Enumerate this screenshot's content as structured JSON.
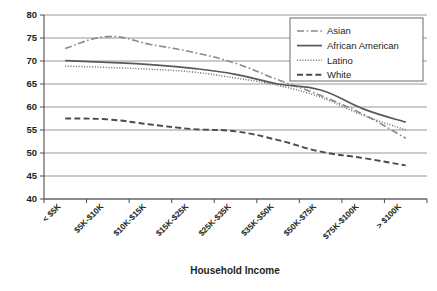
{
  "chart_data": {
    "type": "line",
    "title": "",
    "xlabel": "Household Income",
    "ylabel": "",
    "categories": [
      "< $5K",
      "$5K-$10K",
      "$10K-$15K",
      "$15K-$25K",
      "$25K-$35K",
      "$35K-$50K",
      "$50K-$75K",
      "$75K-$100K",
      "> $100K"
    ],
    "ylim": [
      40,
      80
    ],
    "yticks": [
      40,
      45,
      50,
      55,
      60,
      65,
      70,
      75,
      80
    ],
    "grid": true,
    "legend_position": "top-right",
    "series": [
      {
        "name": "Asian",
        "style": "dash-dot",
        "color": "#8a8a8a",
        "values": [
          72.7,
          75.3,
          73.6,
          71.9,
          69.5,
          65.9,
          62.5,
          58.4,
          53.2
        ]
      },
      {
        "name": "African American",
        "style": "solid",
        "color": "#58595b",
        "values": [
          70.1,
          69.7,
          69.2,
          68.4,
          67.1,
          65.0,
          63.7,
          59.6,
          56.7
        ]
      },
      {
        "name": "Latino",
        "style": "dotted",
        "color": "#6d6e71",
        "values": [
          68.9,
          68.6,
          68.2,
          67.6,
          66.3,
          64.7,
          62.1,
          58.2,
          55.0
        ]
      },
      {
        "name": "White",
        "style": "dashed",
        "color": "#4a4a4a",
        "values": [
          57.5,
          57.3,
          56.2,
          55.2,
          54.7,
          52.8,
          50.3,
          48.9,
          47.3
        ]
      }
    ]
  },
  "legend": {
    "entries": [
      {
        "label": "Asian"
      },
      {
        "label": "African American"
      },
      {
        "label": "Latino"
      },
      {
        "label": "White"
      }
    ]
  },
  "axes": {
    "x_title": "Household Income",
    "y_tick_labels": [
      "80",
      "75",
      "70",
      "65",
      "60",
      "55",
      "50",
      "45",
      "40"
    ],
    "x_tick_labels": [
      "< $5K",
      "$5K-$10K",
      "$10K-$15K",
      "$15K-$25K",
      "$25K-$35K",
      "$35K-$50K",
      "$50K-$75K",
      "$75K-$100K",
      "> $100K"
    ]
  }
}
